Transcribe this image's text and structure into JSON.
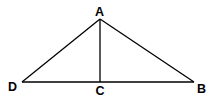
{
  "diagram": {
    "type": "geometry-figure",
    "colors": {
      "line": "#000000",
      "label": "#000000",
      "background": "#ffffff"
    },
    "points": {
      "A": {
        "label": "A",
        "x": 100,
        "y": 19
      },
      "B": {
        "label": "B",
        "x": 194,
        "y": 82
      },
      "C": {
        "label": "C",
        "x": 100,
        "y": 82
      },
      "D": {
        "label": "D",
        "x": 22,
        "y": 82
      }
    },
    "segments": [
      {
        "name": "AD",
        "from": "A",
        "to": "D"
      },
      {
        "name": "AB",
        "from": "A",
        "to": "B"
      },
      {
        "name": "DB",
        "from": "D",
        "to": "B"
      },
      {
        "name": "AC",
        "from": "A",
        "to": "C"
      }
    ],
    "labels": {
      "A": "A",
      "B": "B",
      "C": "C",
      "D": "D"
    }
  }
}
